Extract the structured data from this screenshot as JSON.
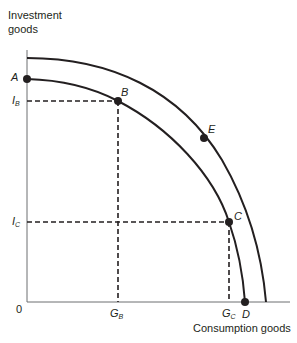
{
  "diagram": {
    "y_axis_label_line1": "Investment",
    "y_axis_label_line2": "goods",
    "x_axis_label": "Consumption goods",
    "origin_label": "0",
    "points": {
      "A": "A",
      "B": "B",
      "C": "C",
      "D": "D",
      "E": "E"
    },
    "y_ticks": {
      "IB_main": "I",
      "IB_sub": "B",
      "IC_main": "I",
      "IC_sub": "C"
    },
    "x_ticks": {
      "GB_main": "G",
      "GB_sub": "B",
      "GC_main": "G",
      "GC_sub": "C"
    },
    "curves": [
      {
        "name": "inner-ppf",
        "through": [
          "A",
          "B",
          "C",
          "D"
        ]
      },
      {
        "name": "outer-ppf",
        "through": [
          "E"
        ]
      }
    ],
    "colors": {
      "line": "#231f20",
      "axis": "#6d6e71"
    }
  }
}
